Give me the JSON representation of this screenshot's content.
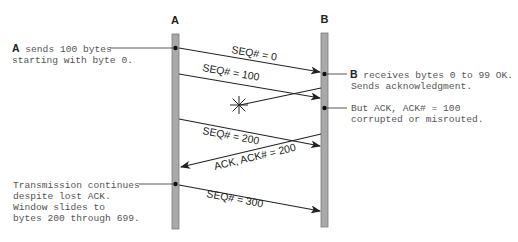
{
  "nodes": {
    "a": {
      "label": "A"
    },
    "b": {
      "label": "B"
    }
  },
  "messages": [
    {
      "id": "seq0",
      "label": "SEQ# = 0",
      "from": "A",
      "to": "B",
      "status": "delivered"
    },
    {
      "id": "seq100",
      "label": "SEQ# = 100",
      "from": "A",
      "to": "B",
      "status": "delivered"
    },
    {
      "id": "ack100",
      "label": "",
      "from": "B",
      "to": "A",
      "status": "lost"
    },
    {
      "id": "seq200",
      "label": "SEQ# = 200",
      "from": "A",
      "to": "B",
      "status": "delivered"
    },
    {
      "id": "ack200",
      "label": "ACK, ACK# = 200",
      "from": "B",
      "to": "A",
      "status": "delivered"
    },
    {
      "id": "seq300",
      "label": "SEQ# = 300",
      "from": "A",
      "to": "B",
      "status": "delivered"
    }
  ],
  "annotations": {
    "a_sends": {
      "bold": "A",
      "line1_rest": " sends 100 bytes",
      "line2": "starting with byte 0."
    },
    "b_receives": {
      "bold": "B",
      "line1_rest": " receives bytes 0 to 99 OK.",
      "line2": "Sends acknowledgment."
    },
    "ack_lost": {
      "line1": "But ACK, ACK# = 100",
      "line2": "corrupted or misrouted."
    },
    "continues": {
      "line1": "Transmission continues",
      "line2": "despite lost ACK.",
      "line3": "Window slides to",
      "line4": "bytes 200 through 699."
    }
  }
}
